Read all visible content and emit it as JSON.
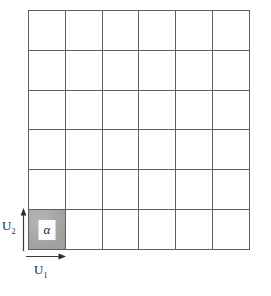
{
  "figure": {
    "title": "",
    "grid": {
      "columns": 6,
      "rows": 6,
      "line_color": "#5f5f5f"
    },
    "shaded_cell": {
      "column": 1,
      "row": 6,
      "position": "bottom-left",
      "fill_color": "#a9a9a9",
      "inner_box_color": "#fdfdfd",
      "label": "α"
    },
    "axes": [
      {
        "name": "horizontal-axis",
        "label_base": "U",
        "label_sub": "1",
        "label": "U₁",
        "direction": "right",
        "color": "#1f1f1f"
      },
      {
        "name": "vertical-axis",
        "label_base": "U",
        "label_sub": "2",
        "label": "U₂",
        "direction": "up",
        "color": "#1f1f1f"
      }
    ]
  }
}
